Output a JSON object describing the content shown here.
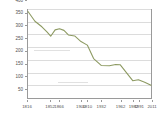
{
  "widget": {
    "name": "line-chart",
    "background": "#ffffff",
    "axis_color": "#9a9a9a",
    "grid_color": "#dcdcdc",
    "tick_label_color": "#4f4f4f"
  },
  "chart_data": {
    "type": "line",
    "title": "",
    "subtitle": "",
    "xlabel": "",
    "ylabel": "",
    "grid": true,
    "legend": false,
    "legend_position": "none",
    "series_color": "#8d9a62",
    "xlim": [
      1816,
      2011
    ],
    "ylim": [
      50,
      400
    ],
    "yticks": [
      400,
      350,
      300,
      250,
      200,
      150,
      100,
      50
    ],
    "ytick_labels": [
      "400",
      "350",
      "300",
      "250",
      "200",
      "150",
      "100",
      "50"
    ],
    "xticks": [
      1816,
      1852,
      1866,
      1900,
      1910,
      1932,
      1962,
      1982,
      1991,
      2011
    ],
    "xtick_labels": [
      "1816",
      "1852",
      "1866",
      "1900",
      "1910",
      "1932",
      "1962",
      "1982",
      "1991",
      "2011"
    ],
    "x": [
      1816,
      1827,
      1838,
      1846,
      1852,
      1859,
      1866,
      1873,
      1880,
      1890,
      1900,
      1910,
      1920,
      1932,
      1945,
      1955,
      1962,
      1972,
      1982,
      1991,
      2001,
      2011
    ],
    "values": [
      390,
      352,
      330,
      310,
      293,
      318,
      322,
      316,
      298,
      294,
      272,
      258,
      205,
      178,
      177,
      182,
      181,
      150,
      118,
      122,
      112,
      100
    ],
    "annotations": []
  }
}
